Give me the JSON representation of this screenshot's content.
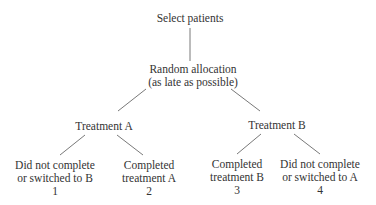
{
  "diagram": {
    "root": {
      "label": "Select patients"
    },
    "randomization": {
      "line1": "Random allocation",
      "line2": "(as late as possible)"
    },
    "arms": [
      {
        "label": "Treatment A",
        "outcomes": [
          {
            "line1": "Did not complete",
            "line2": "or switched to B",
            "number": "1"
          },
          {
            "line1": "Completed",
            "line2": "treatment A",
            "number": "2"
          }
        ]
      },
      {
        "label": "Treatment B",
        "outcomes": [
          {
            "line1": "Completed",
            "line2": "treatment B",
            "number": "3"
          },
          {
            "line1": "Did not complete",
            "line2": "or switched to A",
            "number": "4"
          }
        ]
      }
    ],
    "line_color": "#555555",
    "text_color": "#333333"
  }
}
